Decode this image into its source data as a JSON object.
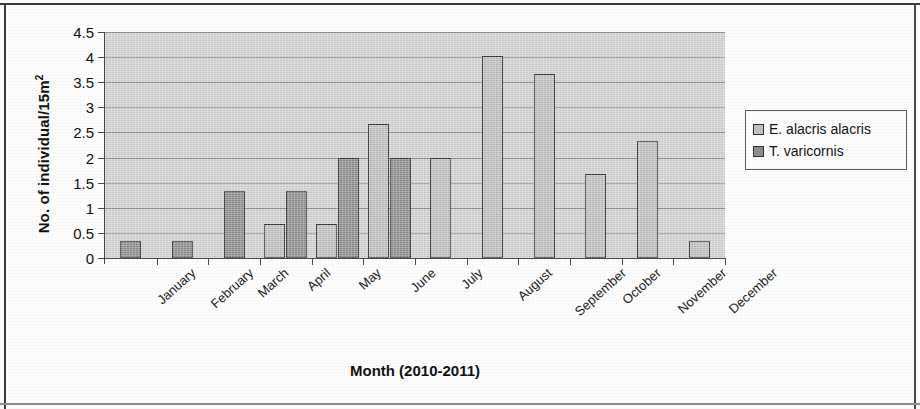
{
  "chart_data": {
    "type": "bar",
    "title": "",
    "xlabel": "Month (2010-2011)",
    "ylabel": "No. of individual/15m",
    "ylabel_sup": "2",
    "ylim": [
      0,
      4.5
    ],
    "ytick_values": [
      0,
      0.5,
      1,
      1.5,
      2,
      2.5,
      3,
      3.5,
      4,
      4.5
    ],
    "ytick_labels": [
      "0",
      "0.5",
      "1",
      "1.5",
      "2",
      "2.5",
      "3",
      "3.5",
      "4",
      "4.5"
    ],
    "grid": true,
    "grid_axis": "y",
    "legend_position": "right",
    "categories": [
      "January",
      "February",
      "March",
      "April",
      "May",
      "June",
      "July",
      "August",
      "September",
      "October",
      "November",
      "December"
    ],
    "series": [
      {
        "name": "E.  alacris alacris",
        "color": "#c2c2c2",
        "values": [
          0,
          0,
          0,
          0.67,
          0.67,
          2.67,
          2.0,
          4.03,
          3.67,
          1.67,
          2.33,
          0.33
        ]
      },
      {
        "name": "T. varicornis",
        "color": "#8f8f8f",
        "values": [
          0.33,
          0.33,
          1.33,
          1.33,
          2.0,
          2.0,
          0,
          0,
          0,
          0,
          0,
          0
        ]
      }
    ]
  },
  "legend": {
    "entries": [
      {
        "label": "E.  alacris alacris",
        "swatch": "series-light"
      },
      {
        "label": "T. varicornis",
        "swatch": "series-dark"
      }
    ]
  }
}
